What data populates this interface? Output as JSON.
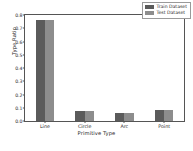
{
  "chart_data": {
    "type": "bar",
    "title": "",
    "xlabel": "Primitive Type",
    "ylabel": "Type Ratio",
    "categories": [
      "Line",
      "Circle",
      "Arc",
      "Point"
    ],
    "series": [
      {
        "name": "Train Dataset",
        "color": "#5b5b5b",
        "values": [
          0.76,
          0.072,
          0.058,
          0.085
        ]
      },
      {
        "name": "Test Dataset",
        "color": "#8d8d8d",
        "values": [
          0.76,
          0.072,
          0.058,
          0.085
        ]
      }
    ],
    "ylim": [
      0.0,
      0.8
    ],
    "yticks": [
      "0.0",
      "0.1",
      "0.2",
      "0.3",
      "0.4",
      "0.5",
      "0.6",
      "0.7",
      "0.8"
    ],
    "ytick_values": [
      0.0,
      0.1,
      0.2,
      0.3,
      0.4,
      0.5,
      0.6,
      0.7,
      0.8
    ],
    "grid": false,
    "legend_position": "upper right"
  },
  "legend": {
    "entries": [
      {
        "label": "Train Dataset",
        "color": "#5b5b5b"
      },
      {
        "label": "Test Dataset",
        "color": "#8d8d8d"
      }
    ]
  },
  "colors": {
    "train": "#5b5b5b",
    "test": "#8d8d8d",
    "axis": "#555555",
    "text": "#2b2b2b",
    "background": "#ffffff"
  }
}
